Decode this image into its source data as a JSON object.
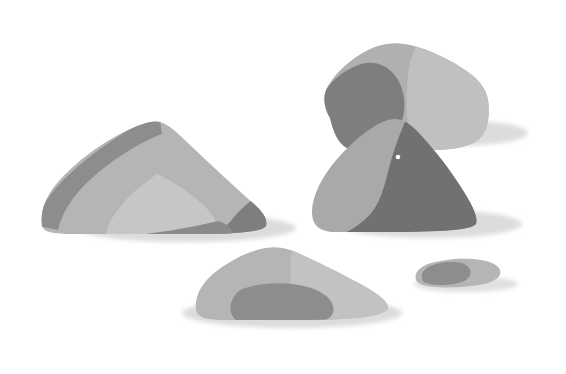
{
  "scene": {
    "title": "Stylized gray rock cluster illustration",
    "subject": "rocks",
    "background_color": "#ffffff",
    "width": 566,
    "height": 374,
    "style": "flat posterized grayscale shapes with soft cast shadows"
  },
  "palette": {
    "background": "#ffffff",
    "tone_darkest": "#717171",
    "tone_dark": "#7e7e7e",
    "tone_mid_dark": "#8d8d8d",
    "tone_mid": "#a9a9a9",
    "tone_base": "#b5b5b5",
    "tone_light": "#c6c6c6",
    "tone_lighter": "#d2d2d2",
    "shadow": "#dcdcdc",
    "shadow_soft": "#e6e6e6",
    "highlight_speck": "#fdfdfd"
  },
  "objects": [
    {
      "id": "rock-large-left",
      "label": "Large left boulder",
      "position": "left-center",
      "facets": [
        {
          "name": "base-body",
          "tone": "#b5b5b5"
        },
        {
          "name": "upper-left-dark-ridge",
          "tone": "#8d8d8d"
        },
        {
          "name": "lower-center-light-patch",
          "tone": "#c6c6c6"
        },
        {
          "name": "lower-right-dark-wedge",
          "tone": "#7e7e7e"
        }
      ],
      "shadow": {
        "tone": "#dcdcdc",
        "direction": "right"
      }
    },
    {
      "id": "rock-top-right-block",
      "label": "Upper right blocky boulder",
      "position": "top-right",
      "facets": [
        {
          "name": "base-body",
          "tone": "#b0b0b0"
        },
        {
          "name": "left-dark-blob",
          "tone": "#7e7e7e"
        },
        {
          "name": "right-light-face",
          "tone": "#c0c0c0"
        }
      ],
      "shadow": {
        "tone": "#dcdcdc",
        "direction": "right"
      }
    },
    {
      "id": "rock-mid-right-dome",
      "label": "Middle right dome rock",
      "position": "center-right",
      "facets": [
        {
          "name": "left-lit-face",
          "tone": "#a9a9a9"
        },
        {
          "name": "right-shadow-face",
          "tone": "#717171"
        }
      ],
      "highlight": {
        "name": "white-speck",
        "tone": "#fdfdfd",
        "x": 398,
        "y": 157
      },
      "shadow": {
        "tone": "#dcdcdc",
        "direction": "right"
      }
    },
    {
      "id": "rock-bottom-center",
      "label": "Bottom center low dome rock",
      "position": "bottom-center",
      "facets": [
        {
          "name": "base-body",
          "tone": "#b5b5b5"
        },
        {
          "name": "right-light-face",
          "tone": "#c2c2c2"
        },
        {
          "name": "lower-dark-blob",
          "tone": "#8d8d8d"
        }
      ],
      "shadow": {
        "tone": "#dcdcdc",
        "direction": "left-and-right"
      }
    },
    {
      "id": "rock-small-right-pebble",
      "label": "Small right pebble",
      "position": "bottom-right",
      "facets": [
        {
          "name": "base-body",
          "tone": "#b5b5b5"
        },
        {
          "name": "left-dark-patch",
          "tone": "#8d8d8d"
        }
      ],
      "shadow": {
        "tone": "#e0e0e0",
        "direction": "right"
      }
    }
  ]
}
